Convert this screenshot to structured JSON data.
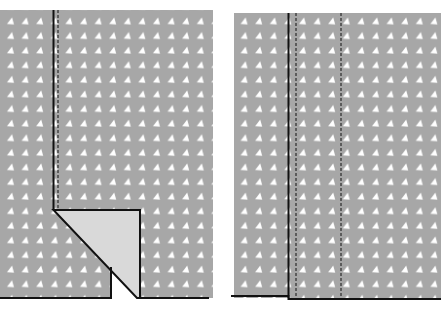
{
  "diagram": {
    "title": "",
    "colors": {
      "fabric": "#a7a7a7",
      "dots": "#ffffff",
      "fold": "#d9d9d9",
      "line": "#111111",
      "background": "#ffffff"
    },
    "panels": [
      {
        "id": "left",
        "label": "",
        "bounds": {
          "x": 0,
          "y": 10,
          "w": 213,
          "h": 288
        },
        "solid_line_x": 53,
        "dashed_line_x": 58,
        "fold_corner_y": 210,
        "fold_right_x": 140,
        "notch_left_x": 111,
        "notch_top_y": 268,
        "bottom_y": 298
      },
      {
        "id": "right",
        "label": "",
        "bounds": {
          "x": 234,
          "y": 13,
          "w": 207,
          "h": 286
        },
        "solid_line_x": 289,
        "dashed_lines_x": [
          296,
          341
        ],
        "bottom_y": 298
      }
    ]
  }
}
